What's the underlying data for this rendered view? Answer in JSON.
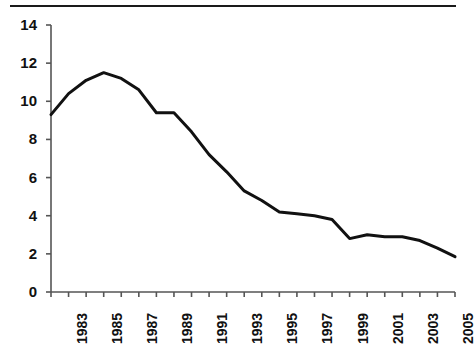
{
  "chart_data": {
    "type": "line",
    "title": "",
    "subtitle": "",
    "xlabel": "",
    "ylabel": "",
    "grid": false,
    "legend": "none",
    "xlim": [
      1982,
      2005
    ],
    "ylim": [
      0,
      14
    ],
    "y_ticks": [
      0,
      2,
      4,
      6,
      8,
      10,
      12,
      14
    ],
    "y_tick_labels": [
      "0",
      "2",
      "4",
      "6",
      "8",
      "10",
      "12",
      "14"
    ],
    "x_tick_labels": [
      "1983",
      "1985",
      "1987",
      "1989",
      "1991",
      "1993",
      "1995",
      "1997",
      "1999",
      "2001",
      "2003",
      "2005"
    ],
    "x_tick_label_years": [
      1983,
      1985,
      1987,
      1989,
      1991,
      1993,
      1995,
      1997,
      1999,
      2001,
      2003,
      2005
    ],
    "x_minor_tick_years": [
      1982,
      1984,
      1986,
      1988,
      1990,
      1992,
      1994,
      1996,
      1998,
      2000,
      2002,
      2004
    ],
    "x": [
      1982,
      1983,
      1984,
      1985,
      1986,
      1987,
      1988,
      1989,
      1990,
      1991,
      1992,
      1993,
      1994,
      1995,
      1996,
      1997,
      1998,
      1999,
      2000,
      2001,
      2002,
      2003,
      2004,
      2005
    ],
    "values": [
      9.3,
      10.4,
      11.1,
      11.5,
      11.2,
      10.6,
      9.4,
      9.4,
      8.4,
      7.2,
      6.3,
      5.3,
      4.8,
      4.2,
      4.1,
      4.0,
      3.8,
      2.8,
      3.0,
      2.9,
      2.9,
      2.7,
      2.3,
      1.85
    ],
    "series": [
      {
        "name": "series-1",
        "color": "#111111",
        "line_width": 3,
        "values": [
          9.3,
          10.4,
          11.1,
          11.5,
          11.2,
          10.6,
          9.4,
          9.4,
          8.4,
          7.2,
          6.3,
          5.3,
          4.8,
          4.2,
          4.1,
          4.0,
          3.8,
          2.8,
          3.0,
          2.9,
          2.9,
          2.7,
          2.3,
          1.85
        ]
      }
    ],
    "axis_color": "#555555",
    "text_color": "#111111"
  },
  "layout": {
    "plot_left": 51,
    "plot_right": 455,
    "plot_top": 25,
    "plot_bottom": 292
  }
}
